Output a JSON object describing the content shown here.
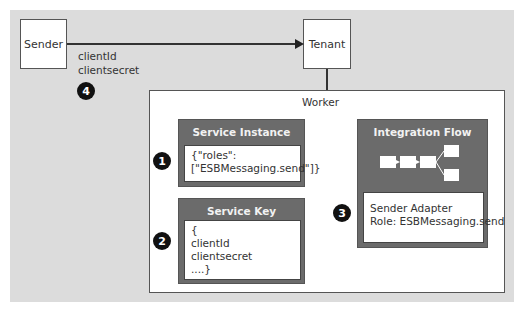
{
  "diagram": {
    "nodes": {
      "sender": "Sender",
      "tenant": "Tenant",
      "worker": "Worker"
    },
    "edge_label": {
      "line1": "clientId",
      "line2": "clientsecret"
    },
    "service_instance": {
      "title": "Service Instance",
      "body": "{\"roles\":\n[\"ESBMessaging.send\"]}"
    },
    "service_key": {
      "title": "Service Key",
      "body": "{\nclientId\nclientsecret\n....}"
    },
    "integration_flow": {
      "title": "Integration Flow",
      "body": "Sender Adapter\nRole: ESBMessaging.send"
    },
    "badges": [
      "1",
      "2",
      "3",
      "4"
    ]
  }
}
